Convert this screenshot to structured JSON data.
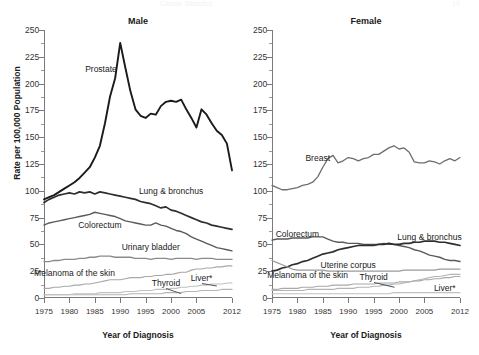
{
  "page": {
    "faint_header": "Cancer Statistics",
    "faint_pageno": "10",
    "ylabel": "Rate per 100,000 Population",
    "xlabel": "Year of Diagnosis"
  },
  "axes": {
    "y_ticks": [
      0,
      25,
      50,
      75,
      100,
      125,
      150,
      175,
      200,
      225,
      250
    ],
    "y_tick_labels": [
      "0",
      "25",
      "50",
      "75",
      "100",
      "125",
      "150",
      "175",
      "200",
      "225",
      "250"
    ],
    "y_minor_step": 12.5,
    "ylim": [
      0,
      250
    ],
    "x_ticks": [
      1975,
      1980,
      1985,
      1990,
      1995,
      2000,
      2005,
      2012
    ],
    "x_tick_labels": [
      "1975",
      "1980",
      "1985",
      "1990",
      "1995",
      "2000",
      "2005",
      "2012"
    ],
    "xlim": [
      1975,
      2012
    ],
    "grid": false
  },
  "panels": [
    {
      "id": "male",
      "title": "Male"
    },
    {
      "id": "female",
      "title": "Female"
    }
  ],
  "annotations": {
    "male": {
      "prostate": "Prostate",
      "lung": "Lung & bronchus",
      "colorectum": "Colorectum",
      "bladder": "Urinary bladder",
      "melanoma": "Melanoma of the skin",
      "thyroid": "Thyroid",
      "liver": "Liver*"
    },
    "female": {
      "breast": "Breast",
      "lung": "Lung & bronchus",
      "colorectum": "Colorectum",
      "uterine": "Uterine corpus",
      "melanoma": "Melanoma of the skin",
      "thyroid": "Thyroid",
      "liver": "Liver*"
    }
  },
  "colors": {
    "prostate": "#1a1a1a",
    "lung": "#2e2e2e",
    "breast": "#6e6e6e",
    "colorectum": "#5a5a5a",
    "bladder": "#8a8a8a",
    "uterine": "#9a9a9a",
    "melanoma": "#a8a8a8",
    "thyroid": "#b4b4b4",
    "liver": "#c0c0c0",
    "axis": "#7a7a7a"
  },
  "chart_data": {
    "type": "line",
    "xlabel": "Year of Diagnosis",
    "ylabel": "Rate per 100,000 Population",
    "ylim": [
      0,
      250
    ],
    "xlim": [
      1975,
      2012
    ],
    "grid": false,
    "legend_position": "inline-annotations",
    "x": [
      1975,
      1976,
      1977,
      1978,
      1979,
      1980,
      1981,
      1982,
      1983,
      1984,
      1985,
      1986,
      1987,
      1988,
      1989,
      1990,
      1991,
      1992,
      1993,
      1994,
      1995,
      1996,
      1997,
      1998,
      1999,
      2000,
      2001,
      2002,
      2003,
      2004,
      2005,
      2006,
      2007,
      2008,
      2009,
      2010,
      2011,
      2012
    ],
    "panels": [
      {
        "name": "Male",
        "series": [
          {
            "name": "Prostate",
            "values": [
              92,
              94,
              96,
              99,
              102,
              105,
              108,
              112,
              117,
              122,
              131,
              142,
              163,
              188,
              205,
              238,
              215,
              193,
              176,
              170,
              168,
              172,
              171,
              179,
              183,
              184,
              183,
              185,
              176,
              168,
              159,
              176,
              171,
              163,
              156,
              152,
              144,
              119
            ]
          },
          {
            "name": "Lung & bronchus",
            "values": [
              89,
              92,
              94,
              96,
              97,
              98,
              97,
              99,
              98,
              99,
              97,
              99,
              98,
              97,
              96,
              95,
              94,
              93,
              92,
              90,
              89,
              88,
              86,
              84,
              85,
              82,
              81,
              79,
              77,
              75,
              73,
              71,
              70,
              68,
              67,
              66,
              65,
              64
            ]
          },
          {
            "name": "Colorectum",
            "values": [
              68,
              70,
              71,
              72,
              73,
              74,
              75,
              76,
              77,
              78,
              80,
              79,
              78,
              77,
              76,
              74,
              72,
              71,
              70,
              69,
              68,
              68,
              70,
              68,
              67,
              65,
              63,
              62,
              60,
              57,
              55,
              53,
              51,
              49,
              47,
              46,
              45,
              44
            ]
          },
          {
            "name": "Urinary bladder",
            "values": [
              34,
              34,
              35,
              35,
              36,
              36,
              36,
              37,
              37,
              38,
              38,
              39,
              39,
              39,
              38,
              38,
              38,
              38,
              37,
              37,
              37,
              36,
              37,
              37,
              37,
              36,
              37,
              37,
              37,
              37,
              36,
              37,
              37,
              37,
              36,
              36,
              36,
              36
            ]
          },
          {
            "name": "Melanoma of the skin",
            "values": [
              9,
              9,
              10,
              10,
              11,
              11,
              12,
              12,
              13,
              13,
              14,
              15,
              16,
              17,
              17,
              17,
              18,
              19,
              19,
              19,
              20,
              20,
              21,
              21,
              22,
              22,
              23,
              24,
              24,
              26,
              27,
              27,
              28,
              28,
              29,
              29,
              30,
              30
            ]
          },
          {
            "name": "Thyroid",
            "values": [
              3,
              3,
              3,
              3,
              3,
              3,
              3,
              3,
              3,
              3,
              3,
              3,
              3,
              3,
              3,
              3,
              3,
              4,
              4,
              4,
              4,
              4,
              4,
              4,
              5,
              5,
              5,
              5,
              6,
              6,
              6,
              7,
              7,
              7,
              7,
              8,
              8,
              8
            ]
          },
          {
            "name": "Liver*",
            "values": [
              3,
              3,
              3,
              3,
              3,
              3,
              4,
              4,
              4,
              4,
              4,
              5,
              5,
              5,
              5,
              5,
              6,
              6,
              6,
              7,
              7,
              7,
              8,
              8,
              8,
              9,
              9,
              10,
              10,
              11,
              11,
              12,
              12,
              13,
              13,
              13,
              14,
              14
            ]
          }
        ]
      },
      {
        "name": "Female",
        "series": [
          {
            "name": "Breast",
            "values": [
              105,
              103,
              101,
              101,
              102,
              103,
              105,
              106,
              108,
              113,
              122,
              130,
              133,
              126,
              128,
              131,
              130,
              128,
              130,
              131,
              134,
              134,
              137,
              140,
              142,
              139,
              140,
              136,
              127,
              126,
              126,
              128,
              127,
              125,
              128,
              130,
              128,
              131
            ]
          },
          {
            "name": "Colorectum",
            "values": [
              54,
              55,
              55,
              55,
              56,
              56,
              56,
              56,
              57,
              57,
              57,
              55,
              53,
              52,
              52,
              51,
              51,
              51,
              50,
              50,
              50,
              50,
              51,
              50,
              50,
              49,
              48,
              47,
              45,
              44,
              42,
              40,
              39,
              38,
              36,
              35,
              35,
              34
            ]
          },
          {
            "name": "Lung & bronchus",
            "values": [
              25,
              26,
              28,
              29,
              31,
              32,
              34,
              35,
              37,
              39,
              41,
              42,
              43,
              45,
              46,
              47,
              48,
              49,
              49,
              49,
              49,
              50,
              50,
              51,
              50,
              50,
              51,
              51,
              52,
              52,
              53,
              53,
              53,
              52,
              52,
              51,
              50,
              49
            ]
          },
          {
            "name": "Uterine corpus",
            "values": [
              35,
              33,
              31,
              29,
              27,
              26,
              26,
              26,
              26,
              26,
              26,
              25,
              25,
              25,
              25,
              25,
              25,
              25,
              25,
              25,
              25,
              25,
              25,
              25,
              25,
              25,
              26,
              26,
              26,
              26,
              26,
              26,
              26,
              27,
              27,
              27,
              27,
              27
            ]
          },
          {
            "name": "Melanoma of the skin",
            "values": [
              8,
              8,
              9,
              9,
              9,
              9,
              10,
              10,
              10,
              11,
              11,
              11,
              12,
              12,
              12,
              12,
              13,
              13,
              13,
              13,
              13,
              14,
              14,
              14,
              14,
              15,
              15,
              15,
              16,
              16,
              17,
              17,
              18,
              18,
              19,
              19,
              20,
              20
            ]
          },
          {
            "name": "Thyroid",
            "values": [
              7,
              7,
              7,
              7,
              7,
              7,
              7,
              8,
              8,
              8,
              8,
              8,
              8,
              9,
              9,
              9,
              9,
              10,
              10,
              10,
              11,
              11,
              12,
              12,
              13,
              13,
              14,
              15,
              16,
              17,
              18,
              19,
              20,
              20,
              21,
              22,
              22,
              22
            ]
          },
          {
            "name": "Liver*",
            "values": [
              4,
              4,
              4,
              4,
              4,
              4,
              4,
              4,
              4,
              4,
              4,
              4,
              4,
              4,
              4,
              4,
              4,
              4,
              4,
              4,
              4,
              4,
              4,
              4,
              5,
              5,
              5,
              5,
              5,
              5,
              5,
              5,
              5,
              5,
              5,
              5,
              5,
              5
            ]
          }
        ]
      }
    ]
  }
}
